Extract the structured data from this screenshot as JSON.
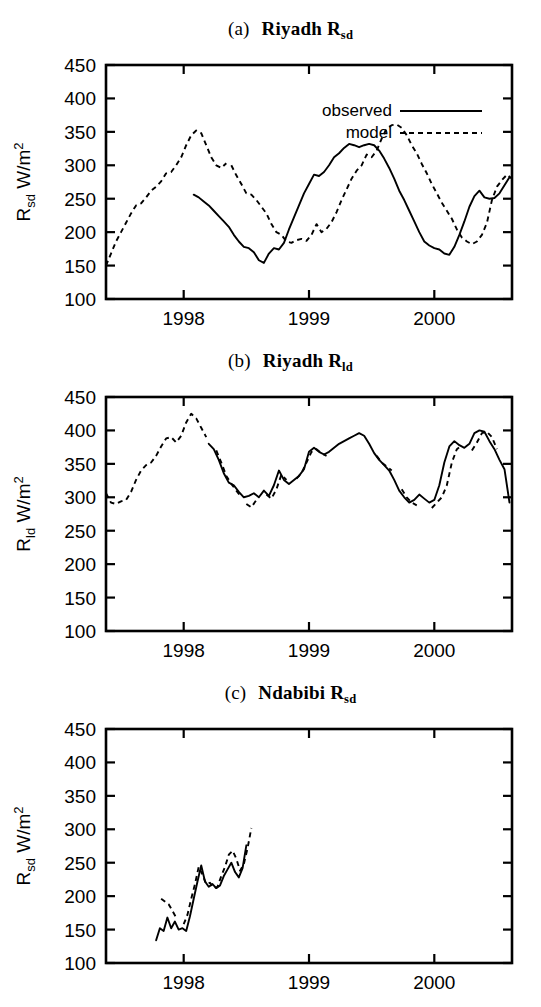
{
  "figure": {
    "width": 541,
    "height": 1007,
    "background": "#ffffff",
    "ink_color": "#000000"
  },
  "legend": {
    "position": "top-right-panel-a",
    "entries": [
      {
        "label": "observed",
        "style": "solid"
      },
      {
        "label": "model",
        "style": "dashed"
      }
    ]
  },
  "panels": [
    {
      "id": "a",
      "tag": "(a)",
      "station": "Riyadh",
      "quantity_base": "R",
      "quantity_sub": "sd",
      "title_text": "(a)   Riyadh R_sd",
      "ylabel_base": "R",
      "ylabel_sub": "sd",
      "ylabel_unit": "W/m",
      "ylabel_unit_sup": "2",
      "ylabel_text": "R_sd W/m2",
      "has_legend": true
    },
    {
      "id": "b",
      "tag": "(b)",
      "station": "Riyadh",
      "quantity_base": "R",
      "quantity_sub": "ld",
      "title_text": "(b)   Riyadh R_ld",
      "ylabel_base": "R",
      "ylabel_sub": "ld",
      "ylabel_unit": "W/m",
      "ylabel_unit_sup": "2",
      "ylabel_text": "R_ld W/m2",
      "has_legend": false
    },
    {
      "id": "c",
      "tag": "(c)",
      "station": "Ndabibi",
      "quantity_base": "R",
      "quantity_sub": "sd",
      "title_text": "(c)   Ndabibi R_sd",
      "ylabel_base": "R",
      "ylabel_sub": "sd",
      "ylabel_unit": "W/m",
      "ylabel_unit_sup": "2",
      "ylabel_text": "R_sd W/m2",
      "has_legend": false
    }
  ],
  "chart_data": [
    {
      "type": "line",
      "panel": "a",
      "title": "(a)   Riyadh Rsd",
      "xlabel": "",
      "ylabel": "Rsd W/m2",
      "xlim": [
        1997.38,
        2000.62
      ],
      "ylim": [
        100,
        450
      ],
      "yticks": [
        100,
        150,
        200,
        250,
        300,
        350,
        400,
        450
      ],
      "xticks": [
        1998,
        1999,
        2000
      ],
      "xtick_labels": [
        "1998",
        "1999",
        "2000"
      ],
      "grid": false,
      "legend": [
        "observed",
        "model"
      ],
      "series": [
        {
          "name": "model",
          "style": "dashed",
          "x": [
            1997.38,
            1997.42,
            1997.46,
            1997.5,
            1997.54,
            1997.58,
            1997.62,
            1997.66,
            1997.7,
            1997.74,
            1997.78,
            1997.82,
            1997.86,
            1997.9,
            1997.94,
            1997.98,
            1998.02,
            1998.06,
            1998.1,
            1998.14,
            1998.18,
            1998.22,
            1998.26,
            1998.3,
            1998.34,
            1998.38,
            1998.42,
            1998.46,
            1998.5,
            1998.54,
            1998.58,
            1998.62,
            1998.66,
            1998.7,
            1998.74,
            1998.78,
            1998.82,
            1998.86,
            1998.9,
            1998.94,
            1998.98,
            1999.02,
            1999.06,
            1999.1,
            1999.14,
            1999.18,
            1999.22,
            1999.26,
            1999.3,
            1999.34,
            1999.38,
            1999.42,
            1999.46,
            1999.5,
            1999.54,
            1999.58,
            1999.62,
            1999.66,
            1999.7,
            1999.74,
            1999.78,
            1999.82,
            1999.86,
            1999.9,
            1999.94,
            1999.98,
            2000.02,
            2000.06,
            2000.1,
            2000.14,
            2000.18,
            2000.22,
            2000.26,
            2000.3,
            2000.34,
            2000.38,
            2000.42,
            2000.46,
            2000.5,
            2000.54,
            2000.58,
            2000.62
          ],
          "y": [
            150,
            168,
            186,
            200,
            214,
            228,
            240,
            243,
            252,
            262,
            268,
            276,
            288,
            290,
            300,
            312,
            330,
            345,
            352,
            348,
            330,
            312,
            300,
            296,
            303,
            300,
            285,
            272,
            258,
            256,
            248,
            238,
            228,
            212,
            200,
            196,
            186,
            184,
            188,
            190,
            187,
            196,
            212,
            200,
            205,
            215,
            230,
            248,
            264,
            280,
            292,
            300,
            316,
            312,
            322,
            340,
            355,
            360,
            361,
            356,
            345,
            330,
            318,
            302,
            288,
            272,
            258,
            244,
            232,
            220,
            204,
            192,
            186,
            182,
            186,
            196,
            214,
            248,
            268,
            278,
            286,
            280
          ],
          "segments": [
            [
              1997.38,
              1998.34
            ],
            [
              1998.38,
              2000.62
            ]
          ]
        },
        {
          "name": "observed",
          "style": "solid",
          "x": [
            1998.08,
            1998.12,
            1998.16,
            1998.2,
            1998.24,
            1998.28,
            1998.32,
            1998.36,
            1998.4,
            1998.44,
            1998.48,
            1998.52,
            1998.56,
            1998.6,
            1998.64,
            1998.68,
            1998.72,
            1998.76,
            1998.8,
            1998.84,
            1998.88,
            1998.92,
            1998.96,
            1999.0,
            1999.04,
            1999.08,
            1999.12,
            1999.16,
            1999.2,
            1999.24,
            1999.28,
            1999.32,
            1999.36,
            1999.4,
            1999.44,
            1999.48,
            1999.52,
            1999.56,
            1999.6,
            1999.64,
            1999.68,
            1999.72,
            1999.76,
            1999.8,
            1999.84,
            1999.88,
            1999.92,
            1999.96,
            2000.0,
            2000.04,
            2000.08,
            2000.12,
            2000.16,
            2000.2,
            2000.24,
            2000.28,
            2000.32,
            2000.36,
            2000.4,
            2000.44,
            2000.48,
            2000.52,
            2000.56,
            2000.6
          ],
          "y": [
            256,
            252,
            246,
            240,
            232,
            224,
            216,
            208,
            196,
            186,
            178,
            176,
            170,
            158,
            154,
            168,
            176,
            174,
            184,
            204,
            222,
            240,
            258,
            272,
            286,
            284,
            290,
            300,
            312,
            318,
            326,
            332,
            330,
            327,
            330,
            332,
            330,
            322,
            310,
            296,
            280,
            262,
            248,
            232,
            216,
            200,
            186,
            180,
            176,
            174,
            168,
            166,
            178,
            196,
            216,
            238,
            254,
            262,
            252,
            250,
            251,
            258,
            270,
            282
          ],
          "segments": [
            [
              1998.08,
              2000.6
            ]
          ]
        }
      ]
    },
    {
      "type": "line",
      "panel": "b",
      "title": "(b)   Riyadh Rld",
      "xlabel": "",
      "ylabel": "Rld W/m2",
      "xlim": [
        1997.38,
        2000.62
      ],
      "ylim": [
        100,
        450
      ],
      "yticks": [
        100,
        150,
        200,
        250,
        300,
        350,
        400,
        450
      ],
      "xticks": [
        1998,
        1999,
        2000
      ],
      "xtick_labels": [
        "1998",
        "1999",
        "2000"
      ],
      "grid": false,
      "legend": [],
      "series": [
        {
          "name": "model",
          "style": "dashed",
          "x": [
            1997.38,
            1997.42,
            1997.46,
            1997.5,
            1997.54,
            1997.58,
            1997.62,
            1997.66,
            1997.7,
            1997.74,
            1997.78,
            1997.82,
            1997.86,
            1997.9,
            1997.94,
            1997.98,
            1998.02,
            1998.06,
            1998.1,
            1998.14,
            1998.18,
            1998.22,
            1998.26,
            1998.3,
            1998.34,
            1998.38,
            1998.42,
            1998.46,
            1998.5,
            1998.54,
            1998.58,
            1998.62,
            1998.66,
            1998.7,
            1998.74,
            1998.78,
            1998.82,
            1998.86,
            1998.9,
            1998.94,
            1998.98,
            1999.02,
            1999.06,
            1999.1,
            1999.14,
            1999.18,
            1999.22,
            1999.26,
            1999.3,
            1999.34,
            1999.38,
            1999.42,
            1999.46,
            1999.5,
            1999.54,
            1999.58,
            1999.62,
            1999.66,
            1999.7,
            1999.74,
            1999.78,
            1999.82,
            1999.86,
            1999.9,
            1999.94,
            1999.98,
            2000.02,
            2000.06,
            2000.1,
            2000.14,
            2000.18,
            2000.22,
            2000.26,
            2000.3,
            2000.34,
            2000.38,
            2000.42,
            2000.46,
            2000.5,
            2000.54,
            2000.58,
            2000.62
          ],
          "y": [
            306,
            292,
            290,
            294,
            296,
            308,
            326,
            340,
            348,
            352,
            362,
            376,
            388,
            390,
            382,
            392,
            412,
            425,
            418,
            404,
            390,
            378,
            370,
            352,
            332,
            320,
            310,
            300,
            290,
            285,
            296,
            300,
            304,
            298,
            312,
            334,
            326,
            320,
            328,
            336,
            352,
            368,
            372,
            366,
            362,
            364,
            372,
            378,
            382,
            390,
            394,
            396,
            390,
            378,
            362,
            352,
            346,
            340,
            328,
            312,
            300,
            292,
            288,
            282,
            286,
            284,
            292,
            300,
            318,
            352,
            372,
            378,
            374,
            370,
            382,
            396,
            398,
            390,
            372,
            358,
            344,
            330
          ],
          "segments": [
            [
              1997.38,
              1998.18
            ],
            [
              1998.26,
              1998.46
            ],
            [
              1998.5,
              1998.6
            ],
            [
              1998.66,
              1998.82
            ],
            [
              1998.9,
              1999.14
            ],
            [
              1999.52,
              1999.66
            ],
            [
              1999.74,
              1999.88
            ],
            [
              1999.96,
              2000.22
            ],
            [
              2000.3,
              2000.5
            ]
          ]
        },
        {
          "name": "observed",
          "style": "solid",
          "x": [
            1998.2,
            1998.24,
            1998.28,
            1998.32,
            1998.36,
            1998.4,
            1998.44,
            1998.48,
            1998.52,
            1998.56,
            1998.6,
            1998.64,
            1998.68,
            1998.72,
            1998.76,
            1998.8,
            1998.84,
            1998.88,
            1998.92,
            1998.96,
            1999.0,
            1999.04,
            1999.08,
            1999.12,
            1999.16,
            1999.2,
            1999.24,
            1999.28,
            1999.32,
            1999.36,
            1999.4,
            1999.44,
            1999.48,
            1999.52,
            1999.56,
            1999.6,
            1999.64,
            1999.68,
            1999.72,
            1999.76,
            1999.8,
            1999.84,
            1999.88,
            1999.92,
            1999.96,
            2000.0,
            2000.04,
            2000.08,
            2000.12,
            2000.16,
            2000.2,
            2000.24,
            2000.28,
            2000.32,
            2000.36,
            2000.4,
            2000.44,
            2000.48,
            2000.52,
            2000.56,
            2000.6
          ],
          "y": [
            380,
            372,
            356,
            336,
            322,
            318,
            308,
            300,
            302,
            306,
            300,
            310,
            302,
            318,
            340,
            326,
            320,
            326,
            332,
            342,
            368,
            374,
            368,
            364,
            368,
            374,
            380,
            384,
            388,
            392,
            396,
            392,
            380,
            366,
            356,
            348,
            340,
            326,
            310,
            300,
            292,
            296,
            304,
            298,
            292,
            296,
            318,
            352,
            376,
            384,
            378,
            374,
            380,
            396,
            400,
            398,
            384,
            372,
            356,
            342,
            292
          ],
          "segments": [
            [
              1998.2,
              2000.6
            ]
          ]
        }
      ]
    },
    {
      "type": "line",
      "panel": "c",
      "title": "(c)   Ndabibi Rsd",
      "xlabel": "",
      "ylabel": "Rsd W/m2",
      "xlim": [
        1997.38,
        2000.62
      ],
      "ylim": [
        100,
        450
      ],
      "yticks": [
        100,
        150,
        200,
        250,
        300,
        350,
        400,
        450
      ],
      "xticks": [
        1998,
        1999,
        2000
      ],
      "xtick_labels": [
        "1998",
        "1999",
        "2000"
      ],
      "grid": false,
      "legend": [],
      "series": [
        {
          "name": "model",
          "style": "dashed",
          "x": [
            1997.82,
            1997.85,
            1997.88,
            1997.91,
            1997.94,
            1997.97,
            1998.0,
            1998.03,
            1998.06,
            1998.09,
            1998.12,
            1998.15,
            1998.18,
            1998.21,
            1998.24,
            1998.27,
            1998.3,
            1998.33,
            1998.36,
            1998.39,
            1998.42,
            1998.45,
            1998.48,
            1998.51,
            1998.54
          ],
          "y": [
            196,
            192,
            188,
            178,
            168,
            160,
            158,
            172,
            196,
            218,
            244,
            232,
            218,
            220,
            212,
            214,
            230,
            244,
            262,
            268,
            256,
            238,
            248,
            272,
            302
          ],
          "segments": [
            [
              1997.82,
              1997.94
            ],
            [
              1998.0,
              1998.54
            ]
          ]
        },
        {
          "name": "observed",
          "style": "solid",
          "x": [
            1997.78,
            1997.81,
            1997.84,
            1997.87,
            1997.9,
            1997.93,
            1997.96,
            1997.99,
            1998.02,
            1998.05,
            1998.08,
            1998.11,
            1998.14,
            1998.17,
            1998.2,
            1998.23,
            1998.26,
            1998.29,
            1998.32,
            1998.35,
            1998.38,
            1998.41,
            1998.44,
            1998.47,
            1998.5
          ],
          "y": [
            134,
            152,
            148,
            168,
            152,
            162,
            150,
            152,
            148,
            170,
            196,
            222,
            246,
            222,
            214,
            218,
            212,
            216,
            230,
            240,
            250,
            236,
            228,
            242,
            276
          ],
          "segments": [
            [
              1997.78,
              1998.5
            ]
          ]
        }
      ]
    }
  ]
}
